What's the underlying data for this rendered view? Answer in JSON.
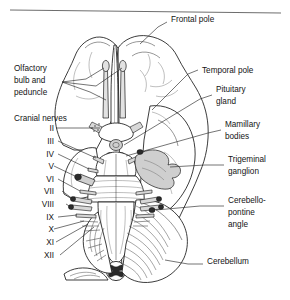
{
  "figure": {
    "has_top_rule": true,
    "line_color": "#2a2a2a",
    "text_color": "#141414"
  },
  "labels_left": [
    {
      "id": "olfactory",
      "text_lines": [
        "Olfactory",
        "bulb and",
        "peduncle"
      ],
      "x": 14,
      "y": 71
    },
    {
      "id": "cranial-nerves",
      "text_lines": [
        "Cranial nerves"
      ],
      "x": 14,
      "y": 121
    }
  ],
  "labels_right": [
    {
      "id": "frontal-pole",
      "text_lines": [
        "Frontal pole"
      ],
      "x": 171,
      "y": 19
    },
    {
      "id": "temporal-pole",
      "text_lines": [
        "Temporal pole"
      ],
      "x": 202,
      "y": 70
    },
    {
      "id": "pituitary-gland",
      "text_lines": [
        "Pituitary",
        "gland"
      ],
      "x": 216,
      "y": 92
    },
    {
      "id": "mamillary-bodies",
      "text_lines": [
        "Mamillary",
        "bodies"
      ],
      "x": 225,
      "y": 127
    },
    {
      "id": "trigeminal-ganglion",
      "text_lines": [
        "Trigeminal",
        "ganglion"
      ],
      "x": 228,
      "y": 162
    },
    {
      "id": "cerebello-pontine-angle",
      "text_lines": [
        "Cerebello-",
        "pontine",
        "angle"
      ],
      "x": 228,
      "y": 203
    },
    {
      "id": "cerebellum",
      "text_lines": [
        "Cerebellum"
      ],
      "x": 207,
      "y": 261
    }
  ],
  "cranial_nerves": [
    {
      "numeral": "II",
      "x": 43,
      "y": 130
    },
    {
      "numeral": "III",
      "x": 43,
      "y": 143
    },
    {
      "numeral": "IV",
      "x": 43,
      "y": 156
    },
    {
      "numeral": "V",
      "x": 43,
      "y": 168
    },
    {
      "numeral": "VI",
      "x": 43,
      "y": 181
    },
    {
      "numeral": "VII",
      "x": 43,
      "y": 193
    },
    {
      "numeral": "VIII",
      "x": 43,
      "y": 206
    },
    {
      "numeral": "IX",
      "x": 43,
      "y": 219
    },
    {
      "numeral": "X",
      "x": 43,
      "y": 231
    },
    {
      "numeral": "XI",
      "x": 43,
      "y": 244
    },
    {
      "numeral": "XII",
      "x": 43,
      "y": 257
    }
  ]
}
